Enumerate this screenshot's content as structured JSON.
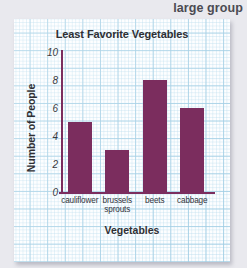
{
  "header": {
    "title": "large group"
  },
  "chart_data": {
    "type": "bar",
    "title": "Least Favorite Vegetables",
    "xlabel": "Vegetables",
    "ylabel": "Number of People",
    "categories": [
      "cauliflower",
      "brussels sprouts",
      "beets",
      "cabbage"
    ],
    "values": [
      5,
      3,
      8,
      6
    ],
    "ylim": [
      0,
      10
    ],
    "yticks": [
      0,
      2,
      4,
      6,
      8,
      10
    ],
    "ytick_labels": [
      "0",
      "2",
      "4",
      "6",
      "8",
      "10"
    ],
    "grid": true,
    "legend": "none",
    "bar_color": "#7b2d5e",
    "axis_color": "#7b2d5e",
    "grid_color": "#96c8e1",
    "paper_color": "#fdfeff"
  },
  "categories_display": [
    {
      "line1": "cauliflower",
      "line2": ""
    },
    {
      "line1": "brussels",
      "line2": "sprouts"
    },
    {
      "line1": "beets",
      "line2": ""
    },
    {
      "line1": "cabbage",
      "line2": ""
    }
  ]
}
